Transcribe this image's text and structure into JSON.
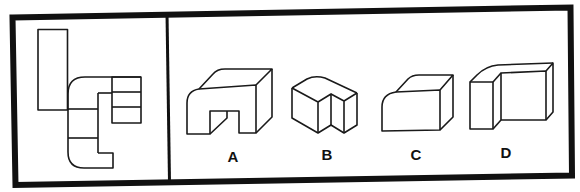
{
  "puzzle": {
    "type": "net-folding",
    "panel_left": {
      "name": "unfolded-net"
    },
    "panel_right": {
      "options": [
        {
          "label": "A",
          "name": "option-a"
        },
        {
          "label": "B",
          "name": "option-b"
        },
        {
          "label": "C",
          "name": "option-c"
        },
        {
          "label": "D",
          "name": "option-d"
        }
      ]
    }
  },
  "colors": {
    "stroke": "#1a1a1a",
    "border": "#111111",
    "background": "#ffffff"
  }
}
